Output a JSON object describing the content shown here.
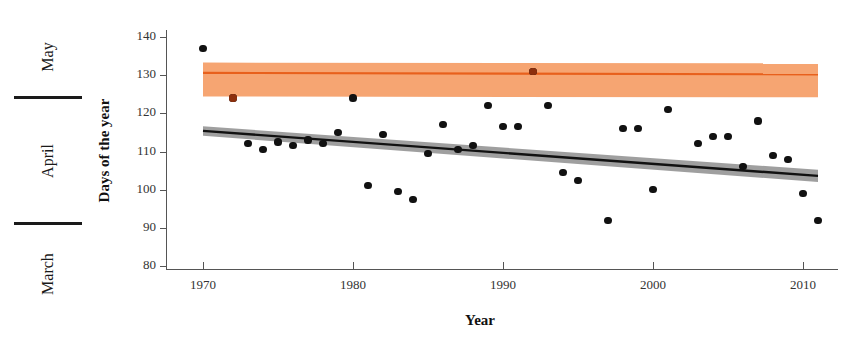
{
  "chart_data": {
    "type": "scatter",
    "title": "",
    "xlabel": "Year",
    "ylabel": "Days of the year",
    "xlim": [
      1968,
      2012
    ],
    "ylim": [
      80,
      142
    ],
    "xticks": [
      1970,
      1980,
      1990,
      2000,
      2010
    ],
    "yticks": [
      80,
      90,
      100,
      110,
      120,
      130,
      140
    ],
    "grid": false,
    "legend": "none",
    "secondary_axis": {
      "label": "Month",
      "categories": [
        "March",
        "April",
        "May"
      ],
      "boundaries": [
        91,
        121
      ],
      "note": "Left-hand ruler maps day-of-year to calendar month"
    },
    "series": [
      {
        "name": "black-series",
        "color": "#111111",
        "marker": "circle",
        "points": [
          {
            "x": 1970,
            "y": 137
          },
          {
            "x": 1972,
            "y": 124
          },
          {
            "x": 1973,
            "y": 112
          },
          {
            "x": 1974,
            "y": 110.5
          },
          {
            "x": 1975,
            "y": 112.5
          },
          {
            "x": 1976,
            "y": 111.5
          },
          {
            "x": 1977,
            "y": 113
          },
          {
            "x": 1978,
            "y": 112
          },
          {
            "x": 1979,
            "y": 115
          },
          {
            "x": 1980,
            "y": 124
          },
          {
            "x": 1981,
            "y": 101
          },
          {
            "x": 1982,
            "y": 114.5
          },
          {
            "x": 1983,
            "y": 99.5
          },
          {
            "x": 1984,
            "y": 97.5
          },
          {
            "x": 1985,
            "y": 109.5
          },
          {
            "x": 1986,
            "y": 117
          },
          {
            "x": 1987,
            "y": 110.5
          },
          {
            "x": 1988,
            "y": 111.5
          },
          {
            "x": 1989,
            "y": 122
          },
          {
            "x": 1990,
            "y": 116.5
          },
          {
            "x": 1991,
            "y": 116.5
          },
          {
            "x": 1992,
            "y": 131
          },
          {
            "x": 1993,
            "y": 122
          },
          {
            "x": 1994,
            "y": 104.5
          },
          {
            "x": 1995,
            "y": 102.5
          },
          {
            "x": 1997,
            "y": 92
          },
          {
            "x": 1998,
            "y": 116
          },
          {
            "x": 1999,
            "y": 116
          },
          {
            "x": 2000,
            "y": 100
          },
          {
            "x": 2001,
            "y": 121
          },
          {
            "x": 2003,
            "y": 112
          },
          {
            "x": 2004,
            "y": 114
          },
          {
            "x": 2005,
            "y": 114
          },
          {
            "x": 2006,
            "y": 106
          },
          {
            "x": 2007,
            "y": 118
          },
          {
            "x": 2008,
            "y": 109
          },
          {
            "x": 2009,
            "y": 108
          },
          {
            "x": 2010,
            "y": 99
          },
          {
            "x": 2011,
            "y": 92
          }
        ]
      },
      {
        "name": "orange-band-series",
        "color": "#8c2f0d",
        "marker": "circle",
        "points": [
          {
            "x": 1972,
            "y": 124
          },
          {
            "x": 1992,
            "y": 131
          }
        ]
      }
    ],
    "trends": [
      {
        "name": "orange-trend",
        "line_color": "#e8601c",
        "band_color": "#f5a06a",
        "band_opacity": 0.95,
        "x_start": 1970,
        "x_end": 2011,
        "y_start": 130.6,
        "y_end": 130.2,
        "band_upper_start": 133.3,
        "band_upper_end": 133.1,
        "band_lower_start": 124.4,
        "band_lower_end": 124.2
      },
      {
        "name": "black-trend",
        "line_color": "#111111",
        "band_color": "#9a9a9a",
        "band_opacity": 0.95,
        "x_start": 1970,
        "x_end": 2011,
        "y_start": 115.4,
        "y_end": 103.6,
        "band_upper_start": 116.6,
        "band_upper_end": 105.2,
        "band_lower_start": 114.1,
        "band_lower_end": 102.0
      }
    ]
  },
  "axes": {
    "y_title": "Days of the year",
    "x_title": "Year",
    "y_tick_labels": [
      "140",
      "130",
      "120",
      "110",
      "100",
      "90",
      "80"
    ],
    "x_tick_labels": [
      "1970",
      "1980",
      "1990",
      "2000",
      "2010"
    ]
  },
  "month_ruler": {
    "labels": [
      "May",
      "April",
      "March"
    ]
  },
  "colors": {
    "orange_line": "#e8601c",
    "orange_band": "#f5a06a",
    "gray_band": "#9a9a9a",
    "black": "#111111",
    "axis": "#555555",
    "background": "#ffffff"
  }
}
